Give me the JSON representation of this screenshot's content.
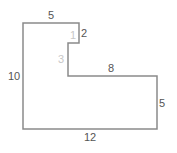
{
  "diagram": {
    "type": "rectilinear-polygon",
    "stroke_color": "#8a8a8a",
    "label_color": "#555555",
    "hidden_label_color": "#c8c8c8",
    "vertices": [
      [
        23,
        23
      ],
      [
        79,
        23
      ],
      [
        79,
        43
      ],
      [
        68,
        43
      ],
      [
        68,
        76
      ],
      [
        157,
        76
      ],
      [
        157,
        129
      ],
      [
        23,
        129
      ]
    ],
    "labels": {
      "top": "5",
      "notch_right": "2",
      "notch_top_inner": "1",
      "notch_left_inner": "3",
      "middle": "8",
      "left": "10",
      "right": "5",
      "bottom": "12"
    }
  }
}
